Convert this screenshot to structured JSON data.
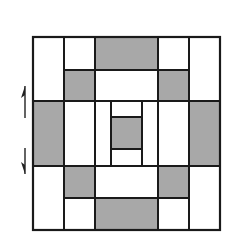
{
  "diagram": {
    "colors": {
      "fill_gray": "#a8a8a8",
      "fill_white": "#ffffff",
      "stroke": "#1a1a1a",
      "arrow": "#222222"
    },
    "outer_frame": {
      "x": 33,
      "y": 37,
      "w": 187,
      "h": 193
    },
    "cells": [
      {
        "name": "cell-top-left-tall",
        "x": 33,
        "y": 37,
        "w": 31,
        "h": 64,
        "fill": "white"
      },
      {
        "name": "cell-top-col2-upper",
        "x": 64,
        "y": 37,
        "w": 31,
        "h": 33,
        "fill": "white"
      },
      {
        "name": "cell-top-center-upper",
        "x": 95,
        "y": 37,
        "w": 63,
        "h": 33,
        "fill": "gray"
      },
      {
        "name": "cell-top-col4-upper",
        "x": 158,
        "y": 37,
        "w": 31,
        "h": 33,
        "fill": "white"
      },
      {
        "name": "cell-top-right-tall",
        "x": 189,
        "y": 37,
        "w": 31,
        "h": 64,
        "fill": "white"
      },
      {
        "name": "cell-top-col2-lower",
        "x": 64,
        "y": 70,
        "w": 31,
        "h": 31,
        "fill": "gray"
      },
      {
        "name": "cell-top-center-lower",
        "x": 95,
        "y": 70,
        "w": 63,
        "h": 31,
        "fill": "white"
      },
      {
        "name": "cell-top-col4-lower",
        "x": 158,
        "y": 70,
        "w": 31,
        "h": 31,
        "fill": "gray"
      },
      {
        "name": "cell-mid-left",
        "x": 33,
        "y": 101,
        "w": 31,
        "h": 65,
        "fill": "gray"
      },
      {
        "name": "cell-mid-col2",
        "x": 64,
        "y": 101,
        "w": 31,
        "h": 65,
        "fill": "white"
      },
      {
        "name": "cell-center-left-strip",
        "x": 95,
        "y": 101,
        "w": 16,
        "h": 65,
        "fill": "white"
      },
      {
        "name": "cell-center-top",
        "x": 111,
        "y": 101,
        "w": 31,
        "h": 16,
        "fill": "white"
      },
      {
        "name": "cell-center-core",
        "x": 111,
        "y": 117,
        "w": 31,
        "h": 32,
        "fill": "gray"
      },
      {
        "name": "cell-center-bottom",
        "x": 111,
        "y": 149,
        "w": 31,
        "h": 17,
        "fill": "white"
      },
      {
        "name": "cell-center-right-strip",
        "x": 142,
        "y": 101,
        "w": 16,
        "h": 65,
        "fill": "white"
      },
      {
        "name": "cell-mid-col4",
        "x": 158,
        "y": 101,
        "w": 31,
        "h": 65,
        "fill": "white"
      },
      {
        "name": "cell-mid-right",
        "x": 189,
        "y": 101,
        "w": 31,
        "h": 65,
        "fill": "gray"
      },
      {
        "name": "cell-bottom-left-tall",
        "x": 33,
        "y": 166,
        "w": 31,
        "h": 64,
        "fill": "white"
      },
      {
        "name": "cell-bottom-col2-upper",
        "x": 64,
        "y": 166,
        "w": 31,
        "h": 32,
        "fill": "gray"
      },
      {
        "name": "cell-bottom-center-upper",
        "x": 95,
        "y": 166,
        "w": 63,
        "h": 32,
        "fill": "white"
      },
      {
        "name": "cell-bottom-col4-upper",
        "x": 158,
        "y": 166,
        "w": 31,
        "h": 32,
        "fill": "gray"
      },
      {
        "name": "cell-bottom-right-tall",
        "x": 189,
        "y": 166,
        "w": 31,
        "h": 64,
        "fill": "white"
      },
      {
        "name": "cell-bottom-col2-lower",
        "x": 64,
        "y": 198,
        "w": 31,
        "h": 32,
        "fill": "white"
      },
      {
        "name": "cell-bottom-center-lower",
        "x": 95,
        "y": 198,
        "w": 63,
        "h": 32,
        "fill": "gray"
      },
      {
        "name": "cell-bottom-col4-lower",
        "x": 158,
        "y": 198,
        "w": 31,
        "h": 32,
        "fill": "white"
      }
    ],
    "arrows": [
      {
        "name": "up-arrow-icon",
        "direction": "up",
        "x": 25,
        "y1": 118,
        "y2": 86
      },
      {
        "name": "down-arrow-icon",
        "direction": "down",
        "x": 25,
        "y1": 148,
        "y2": 174
      }
    ]
  }
}
